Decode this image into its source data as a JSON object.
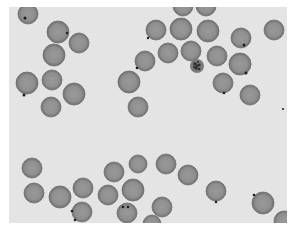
{
  "image": {
    "description": "Thin blood smear micrograph showing red blood cells, several with small dark inclusions, and one parasite-infected cell",
    "canvas": {
      "width": 293,
      "height": 231,
      "border_color": "#ffffff"
    },
    "field": {
      "x": 9,
      "y": 7,
      "width": 278,
      "height": 216,
      "background": "#e4e4e4"
    },
    "colors": {
      "cell_fill": "#8f8f8f",
      "cell_center": "#999999",
      "cell_edge": "#6f6f6f",
      "dot": "#1e1e1e",
      "parasite_fill": "#7a7a7a",
      "parasite_dark": "#2f2f2f"
    },
    "cells": [
      {
        "cx": 28,
        "cy": 14,
        "r": 10
      },
      {
        "cx": 58,
        "cy": 32,
        "r": 11
      },
      {
        "cx": 79,
        "cy": 43,
        "r": 10
      },
      {
        "cx": 54,
        "cy": 55,
        "r": 11
      },
      {
        "cx": 27,
        "cy": 83,
        "r": 11
      },
      {
        "cx": 52,
        "cy": 80,
        "r": 10
      },
      {
        "cx": 74,
        "cy": 94,
        "r": 11
      },
      {
        "cx": 51,
        "cy": 107,
        "r": 10
      },
      {
        "cx": 129,
        "cy": 82,
        "r": 11
      },
      {
        "cx": 138,
        "cy": 107,
        "r": 10
      },
      {
        "cx": 145,
        "cy": 61,
        "r": 10
      },
      {
        "cx": 156,
        "cy": 30,
        "r": 10
      },
      {
        "cx": 168,
        "cy": 53,
        "r": 10
      },
      {
        "cx": 181,
        "cy": 29,
        "r": 11
      },
      {
        "cx": 183,
        "cy": 6,
        "r": 10
      },
      {
        "cx": 206,
        "cy": 6,
        "r": 10
      },
      {
        "cx": 208,
        "cy": 31,
        "r": 11
      },
      {
        "cx": 191,
        "cy": 51,
        "r": 10
      },
      {
        "cx": 217,
        "cy": 56,
        "r": 10
      },
      {
        "cx": 241,
        "cy": 38,
        "r": 10
      },
      {
        "cx": 274,
        "cy": 30,
        "r": 10
      },
      {
        "cx": 240,
        "cy": 64,
        "r": 11
      },
      {
        "cx": 223,
        "cy": 83,
        "r": 10
      },
      {
        "cx": 250,
        "cy": 95,
        "r": 10
      },
      {
        "cx": 32,
        "cy": 168,
        "r": 10
      },
      {
        "cx": 34,
        "cy": 193,
        "r": 10
      },
      {
        "cx": 60,
        "cy": 197,
        "r": 11
      },
      {
        "cx": 83,
        "cy": 188,
        "r": 10
      },
      {
        "cx": 82,
        "cy": 212,
        "r": 10
      },
      {
        "cx": 114,
        "cy": 172,
        "r": 10
      },
      {
        "cx": 138,
        "cy": 164,
        "r": 9
      },
      {
        "cx": 108,
        "cy": 195,
        "r": 10
      },
      {
        "cx": 133,
        "cy": 190,
        "r": 11
      },
      {
        "cx": 127,
        "cy": 213,
        "r": 10
      },
      {
        "cx": 166,
        "cy": 164,
        "r": 10
      },
      {
        "cx": 188,
        "cy": 175,
        "r": 10
      },
      {
        "cx": 162,
        "cy": 207,
        "r": 10
      },
      {
        "cx": 152,
        "cy": 224,
        "r": 9
      },
      {
        "cx": 216,
        "cy": 191,
        "r": 10
      },
      {
        "cx": 263,
        "cy": 203,
        "r": 11
      },
      {
        "cx": 284,
        "cy": 221,
        "r": 10
      }
    ],
    "dots": [
      {
        "cx": 25,
        "cy": 18,
        "r": 1.5
      },
      {
        "cx": 67,
        "cy": 33,
        "r": 1.2
      },
      {
        "cx": 24,
        "cy": 95,
        "r": 1.5
      },
      {
        "cx": 137,
        "cy": 68,
        "r": 1.3
      },
      {
        "cx": 148,
        "cy": 38,
        "r": 1.2
      },
      {
        "cx": 244,
        "cy": 45,
        "r": 1.5
      },
      {
        "cx": 246,
        "cy": 73,
        "r": 1.5
      },
      {
        "cx": 224,
        "cy": 93,
        "r": 1.3
      },
      {
        "cx": 72,
        "cy": 211,
        "r": 1.3
      },
      {
        "cx": 75,
        "cy": 220,
        "r": 1.3
      },
      {
        "cx": 123,
        "cy": 207,
        "r": 1.3
      },
      {
        "cx": 128,
        "cy": 207,
        "r": 1.3
      },
      {
        "cx": 216,
        "cy": 202,
        "r": 1.3
      },
      {
        "cx": 254,
        "cy": 195,
        "r": 1.3
      },
      {
        "cx": 283,
        "cy": 109,
        "r": 1
      }
    ],
    "parasite": {
      "cx": 197,
      "cy": 66,
      "r": 7
    }
  }
}
